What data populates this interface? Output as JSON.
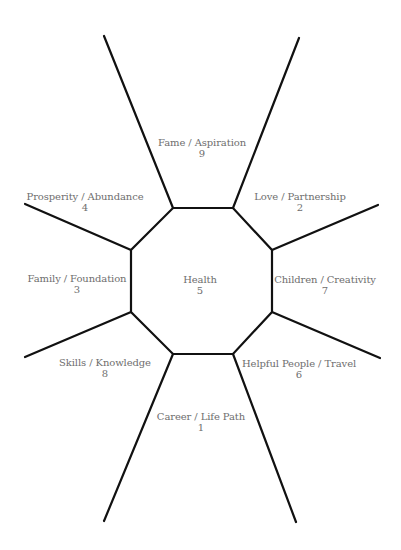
{
  "diagram": {
    "type": "bagua-map",
    "center": {
      "name": "Health",
      "number": "5"
    },
    "areas": [
      {
        "key": "fame",
        "name": "Fame / Aspiration",
        "number": "9",
        "x": 202,
        "y": 137
      },
      {
        "key": "prosperity",
        "name": "Prosperity / Abundance",
        "number": "4",
        "x": 85,
        "y": 191
      },
      {
        "key": "love",
        "name": "Love / Partnership",
        "number": "2",
        "x": 300,
        "y": 191
      },
      {
        "key": "family",
        "name": "Family / Foundation",
        "number": "3",
        "x": 77,
        "y": 273
      },
      {
        "key": "health",
        "name": "Health",
        "number": "5",
        "x": 200,
        "y": 274
      },
      {
        "key": "children",
        "name": "Children / Creativity",
        "number": "7",
        "x": 325,
        "y": 274
      },
      {
        "key": "skills",
        "name": "Skills / Knowledge",
        "number": "8",
        "x": 105,
        "y": 357
      },
      {
        "key": "helpful",
        "name": "Helpful People / Travel",
        "number": "6",
        "x": 299,
        "y": 358
      },
      {
        "key": "career",
        "name": "Career / Life Path",
        "number": "1",
        "x": 201,
        "y": 411
      }
    ],
    "colors": {
      "line": "#111111",
      "text": "#6e6e6e",
      "background": "#ffffff"
    }
  }
}
